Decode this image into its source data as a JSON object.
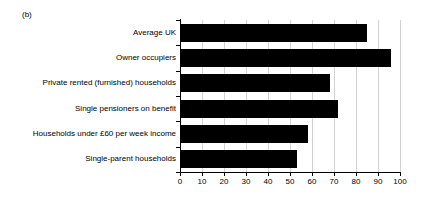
{
  "figure": {
    "panel_caption": "(b)"
  },
  "chart_data": {
    "type": "bar",
    "orientation": "horizontal",
    "title": "",
    "subtitle": "",
    "xlabel": "",
    "ylabel": "",
    "xlim": [
      0,
      100
    ],
    "grid": true,
    "legend": false,
    "bar_color": "#000000",
    "gridline_color": "#d2d2d2",
    "axis_color": "#000000",
    "categories": [
      "Average UK",
      "Owner occupiers",
      "Private rented (furnished) households",
      "Single pensioners on benefit",
      "Households under £60 per week income",
      "Single-parent households"
    ],
    "values": [
      85,
      96,
      68,
      72,
      58,
      53
    ],
    "xticks": [
      0,
      10,
      20,
      30,
      40,
      50,
      60,
      70,
      80,
      90,
      100
    ],
    "xtick_labels": [
      "0",
      "10",
      "20",
      "30",
      "40",
      "50",
      "60",
      "70",
      "80",
      "90",
      "100"
    ]
  }
}
